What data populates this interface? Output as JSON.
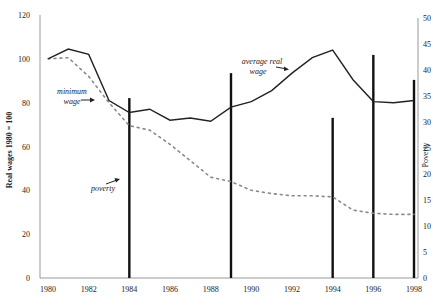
{
  "chart_data": {
    "type": "line",
    "title": "",
    "xlabel": "",
    "ylabel": "Real wages 1980 = 100",
    "y2label": "Poverty",
    "x": [
      1980,
      1981,
      1982,
      1983,
      1984,
      1985,
      1986,
      1987,
      1988,
      1989,
      1990,
      1991,
      1992,
      1993,
      1994,
      1995,
      1996,
      1997,
      1998
    ],
    "xticks": [
      "1980",
      "1982",
      "1984",
      "1986",
      "1988",
      "1990",
      "1992",
      "1994",
      "1996",
      "1998"
    ],
    "ylim": [
      0,
      120
    ],
    "yticks": [
      "0",
      "20",
      "40",
      "60",
      "80",
      "100",
      "120"
    ],
    "y2lim": [
      0,
      50
    ],
    "y2ticks": [
      "0",
      "5",
      "10",
      "15",
      "20",
      "25",
      "30",
      "35",
      "40",
      "45",
      "50"
    ],
    "series": [
      {
        "name": "average real wage",
        "axis": "left",
        "style": "solid",
        "values": [
          100,
          104.5,
          102,
          81,
          75.5,
          77,
          72,
          73,
          71.5,
          78,
          80.5,
          85.5,
          93.5,
          100.5,
          104,
          90.5,
          80.5,
          80,
          81
        ]
      },
      {
        "name": "minimum wage",
        "axis": "left",
        "style": "dotted",
        "values": [
          100,
          100.5,
          92,
          80,
          69.5,
          67.5,
          61,
          53.5,
          46,
          44,
          40,
          38.5,
          37.5,
          37.5,
          37,
          31,
          29.5,
          29,
          29
        ]
      },
      {
        "name": "poverty",
        "axis": "right",
        "style": "vertical-bar",
        "x": [
          1984,
          1989,
          1994,
          1996,
          1998
        ],
        "values": [
          34.6,
          39.4,
          30.8,
          42.9,
          38.1
        ]
      }
    ],
    "annotations": [
      {
        "text": "average real wage",
        "target": "average real wage"
      },
      {
        "text": "minimum wage",
        "target": "minimum wage"
      },
      {
        "text": "poverty",
        "target": "poverty"
      }
    ],
    "grid": false,
    "legend": "inline annotations"
  },
  "labels": {
    "ylabel": "Real wages 1980 = 100",
    "y2label": "Poverty",
    "annot_avg_line1": "average real",
    "annot_avg_line2": "wage",
    "annot_min_line1": "minimum",
    "annot_min_line2": "wage",
    "annot_poverty": "poverty"
  }
}
